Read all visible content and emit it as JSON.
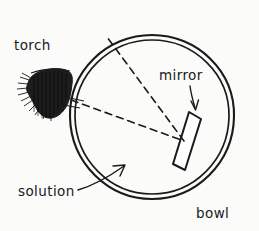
{
  "diagram": {
    "background_color": "#fbfbfa",
    "ink_color": "#1a1a1a",
    "labels": {
      "torch": "torch",
      "mirror": "mirror",
      "solution": "solution",
      "bowl": "bowl"
    },
    "objects": {
      "bowl": {
        "name": "bowl",
        "shape": "double-circle",
        "center_x": 152,
        "center_y": 117,
        "outer_radius": 82,
        "inner_radius": 78
      },
      "mirror": {
        "name": "mirror",
        "shape": "thin-rectangle",
        "top_x": 197,
        "top_y": 115,
        "bottom_x": 176,
        "bottom_y": 167,
        "thickness": 11
      },
      "torch": {
        "name": "torch",
        "shape": "scribbled-blob",
        "center_x": 44,
        "center_y": 90
      }
    },
    "rays": {
      "incident": {
        "name": "incident-ray",
        "style": "dashed",
        "from_x": 60,
        "from_y": 96,
        "to_x": 184,
        "to_y": 140
      },
      "reflected": {
        "name": "reflected-ray",
        "style": "dashed",
        "from_x": 184,
        "from_y": 140,
        "to_x": 107,
        "to_y": 37
      }
    },
    "pointers": {
      "mirror_arrow": {
        "name": "mirror-pointer-arrow",
        "from_x": 190,
        "from_y": 87,
        "to_x": 195,
        "to_y": 110
      },
      "solution_arrow": {
        "name": "solution-pointer-arrow",
        "from_x": 85,
        "from_y": 188,
        "to_x": 122,
        "to_y": 167
      }
    }
  }
}
